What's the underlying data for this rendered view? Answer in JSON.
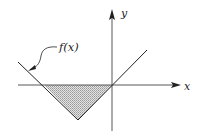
{
  "diagram": {
    "type": "function-graph",
    "axes": {
      "x_label": "x",
      "y_label": "y",
      "origin": [
        112,
        85
      ],
      "x_axis": {
        "from": 18,
        "to": 181
      },
      "y_axis": {
        "from": 130,
        "to": 9
      }
    },
    "function": {
      "label": "f(x)",
      "shape": "V (absolute-value-like)",
      "points": [
        [
          18,
          62
        ],
        [
          44,
          85
        ],
        [
          78,
          120
        ],
        [
          112,
          85
        ],
        [
          147,
          50
        ]
      ],
      "vertex": [
        78,
        120
      ],
      "zeros": [
        [
          44,
          85
        ],
        [
          112,
          85
        ]
      ]
    },
    "shaded_region": {
      "description": "area between f(x) and x-axis where f(x) < 0",
      "polygon": [
        [
          44,
          85
        ],
        [
          78,
          120
        ],
        [
          112,
          85
        ]
      ],
      "fill": "#bdbdbd",
      "pattern": "stipple"
    },
    "annotation": {
      "text": "f(x)",
      "leader_from": [
        58,
        47
      ],
      "arrow_to": [
        30,
        70
      ]
    },
    "colors": {
      "line": "#222222",
      "axis": "#333333",
      "shade": "#c4c4c4",
      "background": "#ffffff"
    }
  }
}
